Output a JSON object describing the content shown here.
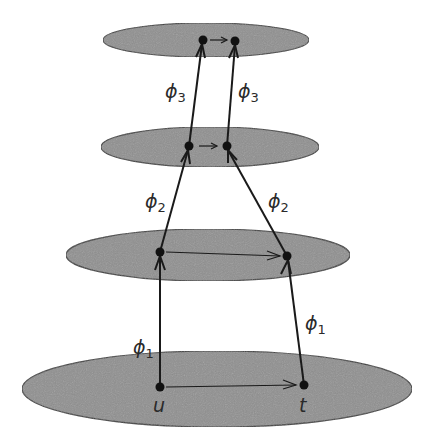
{
  "diagram": {
    "colors": {
      "ellipse_fill": "#8f8f8f",
      "ellipse_stroke": "#3a3a3a",
      "line": "#1a1a1a",
      "background": "#ffffff"
    },
    "layers": [
      {
        "name": "level-1",
        "cx": 217,
        "cy": 389,
        "rx": 195,
        "ry": 38
      },
      {
        "name": "level-2",
        "cx": 208,
        "cy": 255,
        "rx": 142,
        "ry": 26
      },
      {
        "name": "level-3",
        "cx": 210,
        "cy": 147,
        "rx": 109,
        "ry": 20
      },
      {
        "name": "level-4",
        "cx": 206,
        "cy": 40,
        "rx": 103,
        "ry": 17
      }
    ],
    "nodes": {
      "u_label": "u",
      "t_label": "t"
    },
    "maps": [
      {
        "symbol": "ϕ",
        "index": "1"
      },
      {
        "symbol": "ϕ",
        "index": "2"
      },
      {
        "symbol": "ϕ",
        "index": "3"
      }
    ]
  }
}
